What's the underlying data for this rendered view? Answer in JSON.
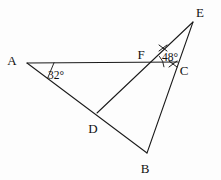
{
  "figure": {
    "background_color": "#fdfdfd",
    "stroke_color": "#1a1a1a",
    "width": 221,
    "height": 180
  },
  "points": {
    "A": {
      "label": "A",
      "x": 27,
      "y": 63,
      "label_x": 12,
      "label_y": 65
    },
    "B": {
      "label": "B",
      "x": 147,
      "y": 153,
      "label_x": 145,
      "label_y": 173
    },
    "C": {
      "label": "C",
      "x": 178,
      "y": 62,
      "label_x": 181,
      "label_y": 75
    },
    "D": {
      "label": "D",
      "x": 97,
      "y": 113,
      "label_x": 89,
      "label_y": 133
    },
    "E": {
      "label": "E",
      "x": 193,
      "y": 22,
      "label_x": 197,
      "label_y": 17
    },
    "F": {
      "label": "F",
      "x": 148,
      "y": 68,
      "label_x": 138,
      "label_y": 59
    }
  },
  "segments": [
    {
      "name": "segment-AC",
      "from": "A",
      "to": "C"
    },
    {
      "name": "segment-AB",
      "from": "A",
      "to": "B"
    },
    {
      "name": "segment-DE",
      "from": "D",
      "to": "E"
    },
    {
      "name": "segment-BE",
      "from": "B",
      "to": "E"
    }
  ],
  "angles": [
    {
      "name": "angle-at-A",
      "vertex": "A",
      "value": "32°",
      "label_x": 48,
      "label_y": 78
    },
    {
      "name": "angle-at-F",
      "vertex": "F",
      "value": "48°",
      "label_x": 157,
      "label_y": 62
    }
  ],
  "tick_marks": [
    {
      "name": "tick-on-FE",
      "x": 163,
      "y": 48
    },
    {
      "name": "tick-on-FC",
      "x": 173,
      "y": 64
    }
  ]
}
